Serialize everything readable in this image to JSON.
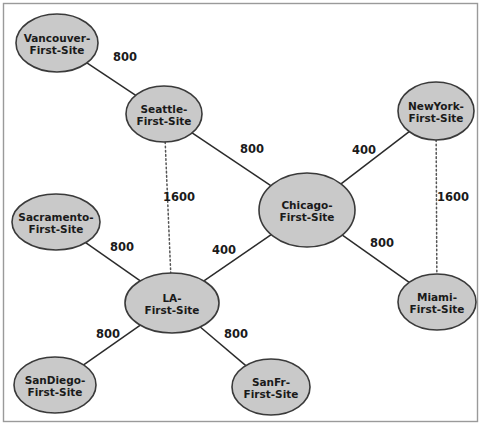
{
  "diagram": {
    "type": "network-topology",
    "title": "",
    "background_color": "#ffffff",
    "node_fill_color": "#c9c9c9",
    "node_stroke_color": "#3a3a3a",
    "edge_color": "#2b2b2b",
    "frame_color": "#9a9a9a",
    "nodes": [
      {
        "id": "vancouver",
        "line1": "Vancouver-",
        "line2": "First-Site",
        "cx": 57,
        "cy": 43,
        "rx": 41,
        "ry": 29
      },
      {
        "id": "seattle",
        "line1": "Seattle-",
        "line2": "First-Site",
        "cx": 164,
        "cy": 114,
        "rx": 38,
        "ry": 28
      },
      {
        "id": "newyork",
        "line1": "NewYork-",
        "line2": "First-Site",
        "cx": 436,
        "cy": 111,
        "rx": 38,
        "ry": 29
      },
      {
        "id": "sacramento",
        "line1": "Sacramento-",
        "line2": "First-Site",
        "cx": 56,
        "cy": 222,
        "rx": 44,
        "ry": 28
      },
      {
        "id": "chicago",
        "line1": "Chicago-",
        "line2": "First-Site",
        "cx": 307,
        "cy": 210,
        "rx": 48,
        "ry": 37
      },
      {
        "id": "la",
        "line1": "LA-",
        "line2": "First-Site",
        "cx": 172,
        "cy": 303,
        "rx": 47,
        "ry": 30
      },
      {
        "id": "miami",
        "line1": "Miami-",
        "line2": "First-Site",
        "cx": 437,
        "cy": 302,
        "rx": 39,
        "ry": 28
      },
      {
        "id": "sandiego",
        "line1": "SanDiego-",
        "line2": "First-Site",
        "cx": 55,
        "cy": 385,
        "rx": 41,
        "ry": 28
      },
      {
        "id": "sanfr",
        "line1": "SanFr-",
        "line2": "First-Site",
        "cx": 271,
        "cy": 387,
        "rx": 39,
        "ry": 28
      }
    ],
    "edges": [
      {
        "id": "vancouver-seattle",
        "from": "vancouver",
        "to": "seattle",
        "cost": "800",
        "style": "solid",
        "label_x": 125,
        "label_y": 61
      },
      {
        "id": "seattle-chicago",
        "from": "seattle",
        "to": "chicago",
        "cost": "800",
        "style": "solid",
        "label_x": 252,
        "label_y": 153
      },
      {
        "id": "chicago-newyork",
        "from": "chicago",
        "to": "newyork",
        "cost": "400",
        "style": "solid",
        "label_x": 364,
        "label_y": 154
      },
      {
        "id": "seattle-la",
        "from": "seattle",
        "to": "la",
        "cost": "1600",
        "style": "dotted",
        "label_x": 179,
        "label_y": 201
      },
      {
        "id": "newyork-miami",
        "from": "newyork",
        "to": "miami",
        "cost": "1600",
        "style": "dotted",
        "label_x": 453,
        "label_y": 201
      },
      {
        "id": "sacramento-la",
        "from": "sacramento",
        "to": "la",
        "cost": "800",
        "style": "solid",
        "label_x": 122,
        "label_y": 251
      },
      {
        "id": "la-chicago",
        "from": "la",
        "to": "chicago",
        "cost": "400",
        "style": "solid",
        "label_x": 224,
        "label_y": 254
      },
      {
        "id": "chicago-miami",
        "from": "chicago",
        "to": "miami",
        "cost": "800",
        "style": "solid",
        "label_x": 382,
        "label_y": 247
      },
      {
        "id": "la-sandiego",
        "from": "la",
        "to": "sandiego",
        "cost": "800",
        "style": "solid",
        "label_x": 108,
        "label_y": 338
      },
      {
        "id": "la-sanfr",
        "from": "la",
        "to": "sanfr",
        "cost": "800",
        "style": "solid",
        "label_x": 236,
        "label_y": 338
      }
    ]
  }
}
